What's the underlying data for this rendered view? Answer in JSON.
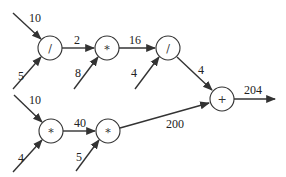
{
  "diagram": {
    "type": "computational-graph",
    "nodes": [
      {
        "id": "n1",
        "op": "/",
        "cx": 50,
        "cy": 48
      },
      {
        "id": "n2",
        "op": "*",
        "cx": 107,
        "cy": 48
      },
      {
        "id": "n3",
        "op": "/",
        "cx": 168,
        "cy": 48
      },
      {
        "id": "n4",
        "op": "+",
        "cx": 222,
        "cy": 99
      },
      {
        "id": "n5",
        "op": "*",
        "cx": 51,
        "cy": 131
      },
      {
        "id": "n6",
        "op": "*",
        "cx": 108,
        "cy": 131
      }
    ],
    "edges": [
      {
        "from": "input",
        "to": "n1",
        "value": "10"
      },
      {
        "from": "input",
        "to": "n1",
        "value": "5"
      },
      {
        "from": "n1",
        "to": "n2",
        "value": "2"
      },
      {
        "from": "input",
        "to": "n2",
        "value": "8"
      },
      {
        "from": "n2",
        "to": "n3",
        "value": "16"
      },
      {
        "from": "input",
        "to": "n3",
        "value": "4"
      },
      {
        "from": "n3",
        "to": "n4",
        "value": "4"
      },
      {
        "from": "input",
        "to": "n5",
        "value": "10"
      },
      {
        "from": "input",
        "to": "n5",
        "value": "4"
      },
      {
        "from": "n5",
        "to": "n6",
        "value": "40"
      },
      {
        "from": "input",
        "to": "n6",
        "value": "5"
      },
      {
        "from": "n6",
        "to": "n4",
        "value": "200"
      },
      {
        "from": "n4",
        "to": "output",
        "value": "204"
      }
    ]
  }
}
